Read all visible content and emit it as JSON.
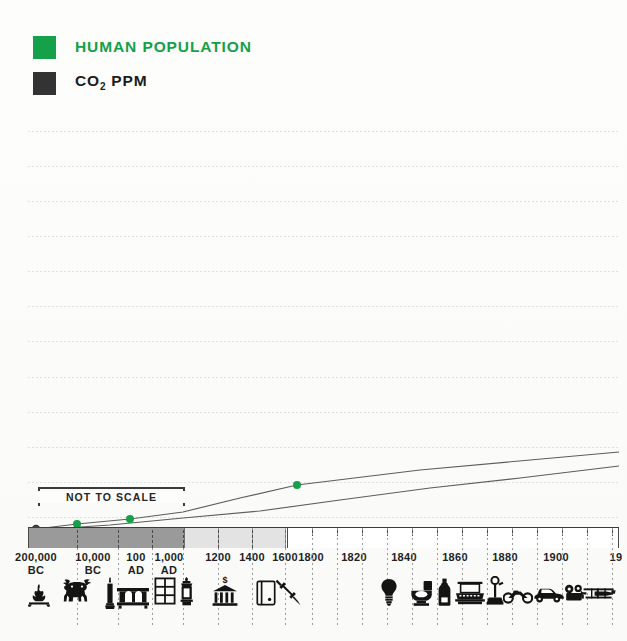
{
  "legend": {
    "items": [
      {
        "label": "HUMAN POPULATION",
        "color": "#15a04a",
        "name": "human-population"
      },
      {
        "label": "CO",
        "sub": "2",
        "label_tail": " PPM",
        "color": "#333333",
        "name": "co2-ppm"
      }
    ]
  },
  "annotations": {
    "not_to_scale": "NOT TO SCALE"
  },
  "axis": {
    "labels": [
      {
        "line1": "200,000",
        "line2": "BC",
        "x": 36
      },
      {
        "line1": "10,000",
        "line2": "BC",
        "x": 93
      },
      {
        "line1": "100",
        "line2": "AD",
        "x": 136
      },
      {
        "line1": "1,000",
        "line2": "AD",
        "x": 169
      },
      {
        "line1": "1200",
        "line2": "",
        "x": 218
      },
      {
        "line1": "1400",
        "line2": "",
        "x": 252
      },
      {
        "line1": "1600",
        "line2": "",
        "x": 285
      },
      {
        "line1": "1800",
        "line2": "",
        "x": 311
      },
      {
        "line1": "1820",
        "line2": "",
        "x": 354
      },
      {
        "line1": "1840",
        "line2": "",
        "x": 404
      },
      {
        "line1": "1860",
        "line2": "",
        "x": 455
      },
      {
        "line1": "1880",
        "line2": "",
        "x": 505
      },
      {
        "line1": "1900",
        "line2": "",
        "x": 556
      },
      {
        "line1": "19",
        "line2": "",
        "x": 616
      }
    ]
  },
  "icons": [
    {
      "name": "campfire-icon",
      "x": 30,
      "y": 582
    },
    {
      "name": "ox-icon",
      "x": 62,
      "y": 580
    },
    {
      "name": "candle-icon",
      "x": 105,
      "y": 580
    },
    {
      "name": "furnace-icon",
      "x": 118,
      "y": 584
    },
    {
      "name": "window-grid-icon",
      "x": 155,
      "y": 580
    },
    {
      "name": "lantern-icon",
      "x": 178,
      "y": 580
    },
    {
      "name": "bank-icon",
      "x": 215,
      "y": 580
    },
    {
      "name": "ledger-icon",
      "x": 258,
      "y": 582
    },
    {
      "name": "syringe-icon",
      "x": 277,
      "y": 580
    },
    {
      "name": "lightbulb-icon",
      "x": 381,
      "y": 580
    },
    {
      "name": "toilet-icon",
      "x": 412,
      "y": 582
    },
    {
      "name": "bottle-icon",
      "x": 438,
      "y": 580
    },
    {
      "name": "typewriter-icon",
      "x": 457,
      "y": 583
    },
    {
      "name": "telephone-icon",
      "x": 487,
      "y": 579
    },
    {
      "name": "motorcycle-icon",
      "x": 505,
      "y": 588
    },
    {
      "name": "automobile-icon",
      "x": 533,
      "y": 585
    },
    {
      "name": "film-camera-icon",
      "x": 565,
      "y": 586
    },
    {
      "name": "biplane-icon",
      "x": 582,
      "y": 586
    }
  ],
  "chart_data": {
    "type": "line",
    "title": "",
    "xlabel": "",
    "ylabel": "",
    "grid": true,
    "legend_position": "top-left",
    "x_tick_labels": [
      "200,000 BC",
      "10,000 BC",
      "100 AD",
      "1,000 AD",
      "1200",
      "1400",
      "1600",
      "1800",
      "1820",
      "1840",
      "1860",
      "1880",
      "1900",
      "19"
    ],
    "axis_note": "NOT TO SCALE",
    "series": [
      {
        "name": "HUMAN POPULATION",
        "color": "#15a04a",
        "marker_points": [
          {
            "x": 36,
            "y": 529,
            "label": "200,000 BC"
          },
          {
            "x": 77,
            "y": 524,
            "label": "10,000 BC"
          },
          {
            "x": 130,
            "y": 519,
            "label": "1,000 AD"
          },
          {
            "x": 297,
            "y": 485,
            "label": "1800"
          }
        ],
        "path": [
          {
            "x": 36,
            "y": 529
          },
          {
            "x": 77,
            "y": 524
          },
          {
            "x": 130,
            "y": 519
          },
          {
            "x": 183,
            "y": 512
          },
          {
            "x": 240,
            "y": 498
          },
          {
            "x": 297,
            "y": 485
          },
          {
            "x": 420,
            "y": 470
          },
          {
            "x": 619,
            "y": 452
          }
        ]
      },
      {
        "name": "CO2 PPM",
        "color": "#4a4a4a",
        "marker_points": [
          {
            "x": 36,
            "y": 530,
            "label": "200,000 BC"
          }
        ],
        "path": [
          {
            "x": 36,
            "y": 530
          },
          {
            "x": 110,
            "y": 525
          },
          {
            "x": 183,
            "y": 518
          },
          {
            "x": 260,
            "y": 511
          },
          {
            "x": 340,
            "y": 500
          },
          {
            "x": 430,
            "y": 488
          },
          {
            "x": 520,
            "y": 478
          },
          {
            "x": 619,
            "y": 466
          }
        ]
      }
    ]
  }
}
